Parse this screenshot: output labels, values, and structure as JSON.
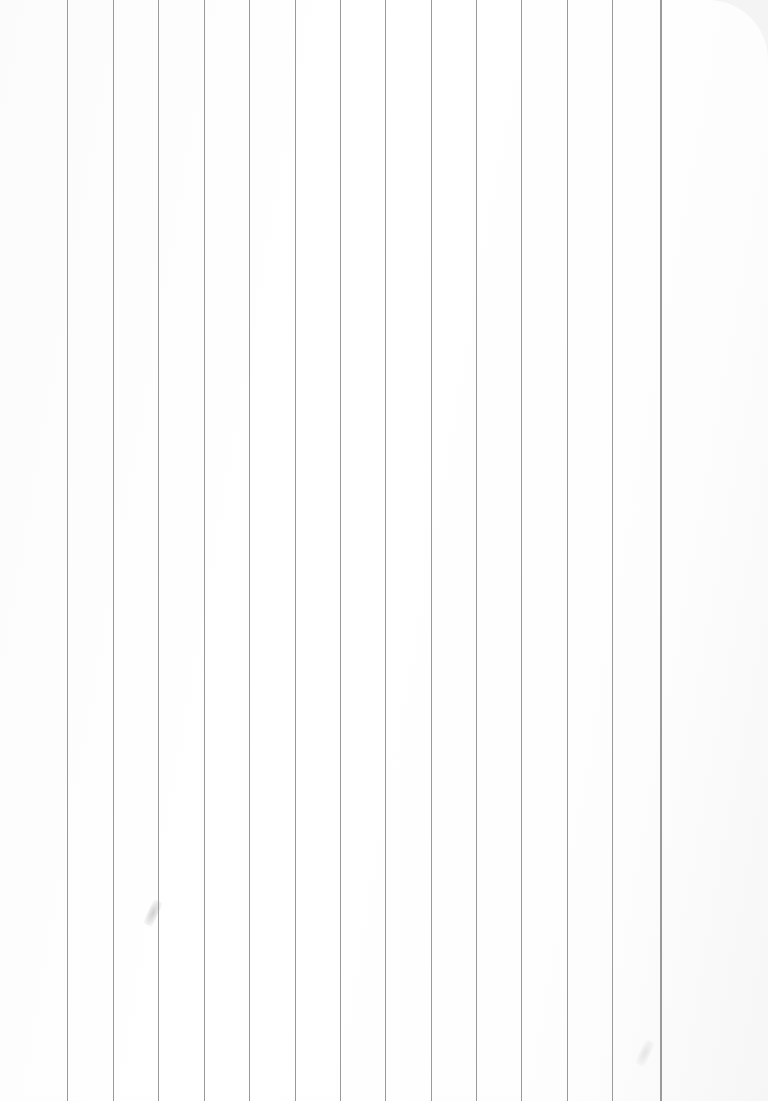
{
  "image": {
    "description": "Blank sheet of white paper with vertical gray ruled lines",
    "background_color": "#ffffff",
    "line_color": "#9a9a9a",
    "line_count": 14,
    "line_positions_x": [
      67,
      113,
      158,
      204,
      249,
      295,
      340,
      385,
      431,
      476,
      521,
      567,
      612,
      660
    ],
    "text": []
  }
}
